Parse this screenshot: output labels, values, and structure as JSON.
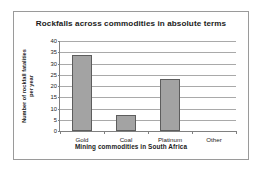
{
  "chart_data": {
    "type": "bar",
    "title": "Rockfalls across commodities in absolute terms",
    "xlabel": "Mining commodities in South Africa",
    "ylabel_line1": "Number of rockfall fatalities",
    "ylabel_line2": "per year",
    "categories": [
      "Gold",
      "Coal",
      "Platinum",
      "Other"
    ],
    "values": [
      34,
      7,
      23,
      0
    ],
    "ylim": [
      0,
      40
    ],
    "ytick_labels": [
      "40",
      "35",
      "30",
      "25",
      "20",
      "15",
      "10",
      "5",
      "0"
    ],
    "ytick_values": [
      40,
      35,
      30,
      25,
      20,
      15,
      10,
      5,
      0
    ],
    "grid": "horizontal",
    "legend": "none",
    "bar_color": "#a3a3a3",
    "bar_edge_color": "#5d5d5d",
    "gridline_color": "#a9a9a9",
    "axis_color": "#808080",
    "frame_color": "#9a9a9a",
    "background": "#ffffff"
  }
}
